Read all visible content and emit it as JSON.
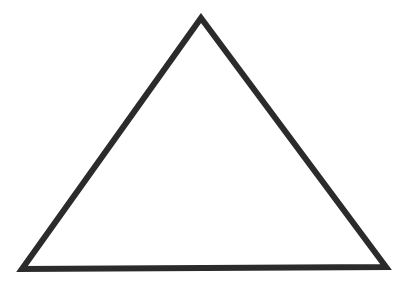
{
  "figure": {
    "shape": "triangle",
    "stroke_color": "#2b2b2b",
    "fill_color": "#ffffff",
    "background": "#ffffff",
    "stroke_width": 6,
    "vertices": {
      "apex": [
        201,
        18
      ],
      "bottom_left": [
        22,
        269
      ],
      "bottom_right": [
        386,
        267
      ]
    }
  }
}
